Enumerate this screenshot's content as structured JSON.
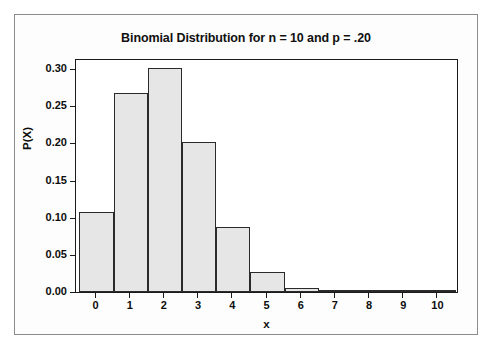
{
  "chart_data": {
    "type": "bar",
    "title": "Binomial Distribution for n = 10 and p = .20",
    "xlabel": "x",
    "ylabel": "P(X)",
    "categories": [
      "0",
      "1",
      "2",
      "3",
      "4",
      "5",
      "6",
      "7",
      "8",
      "9",
      "10"
    ],
    "values": [
      0.1074,
      0.2684,
      0.302,
      0.2013,
      0.0881,
      0.0264,
      0.0055,
      0.0008,
      0.0001,
      0.0,
      0.0
    ],
    "xlim": [
      -0.6,
      10.6
    ],
    "ylim": [
      0.0,
      0.315
    ],
    "xticks": [
      "0",
      "1",
      "2",
      "3",
      "4",
      "5",
      "6",
      "7",
      "8",
      "9",
      "10"
    ],
    "yticks": [
      "0.00",
      "0.05",
      "0.10",
      "0.15",
      "0.20",
      "0.25",
      "0.30"
    ],
    "ytick_values": [
      0.0,
      0.05,
      0.1,
      0.15,
      0.2,
      0.25,
      0.3
    ],
    "grid": false,
    "legend": null,
    "bar_fill_color": "#e6e6e6",
    "bar_edge_color": "#2a2a2a",
    "frame_color": "#1a1a1a",
    "card_border_color": "#8c8c8c",
    "background_color": "#ffffff"
  }
}
